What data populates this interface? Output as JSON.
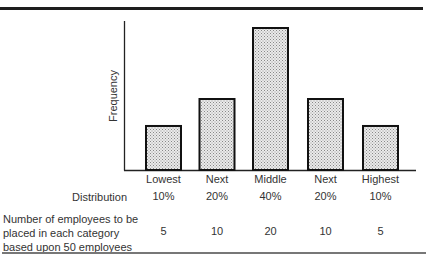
{
  "chart_data": {
    "type": "bar",
    "title": "",
    "xlabel": "",
    "ylabel": "Frequency",
    "categories": [
      "Lowest",
      "Next",
      "Middle",
      "Next",
      "Highest"
    ],
    "series": [
      {
        "name": "Distribution",
        "values": [
          10,
          20,
          40,
          20,
          10
        ],
        "unit": "%"
      },
      {
        "name": "Number of employees to be placed in each category based upon 50 employees",
        "values": [
          5,
          10,
          20,
          10,
          5
        ]
      }
    ],
    "ylim": [
      0,
      42
    ],
    "grid": false,
    "legend": "none",
    "bar_fill": "stippled gray"
  },
  "table": {
    "distribution_label": "Distribution",
    "distribution_values": [
      "10%",
      "20%",
      "40%",
      "20%",
      "10%"
    ],
    "employees_label_lines": [
      "Number of employees to be",
      "placed in each category",
      "based upon 50 employees"
    ],
    "employees_values": [
      "5",
      "10",
      "20",
      "10",
      "5"
    ]
  },
  "colors": {
    "bar_border": "#111111",
    "bar_fill": "#d4d4d4",
    "axis": "#222222"
  }
}
